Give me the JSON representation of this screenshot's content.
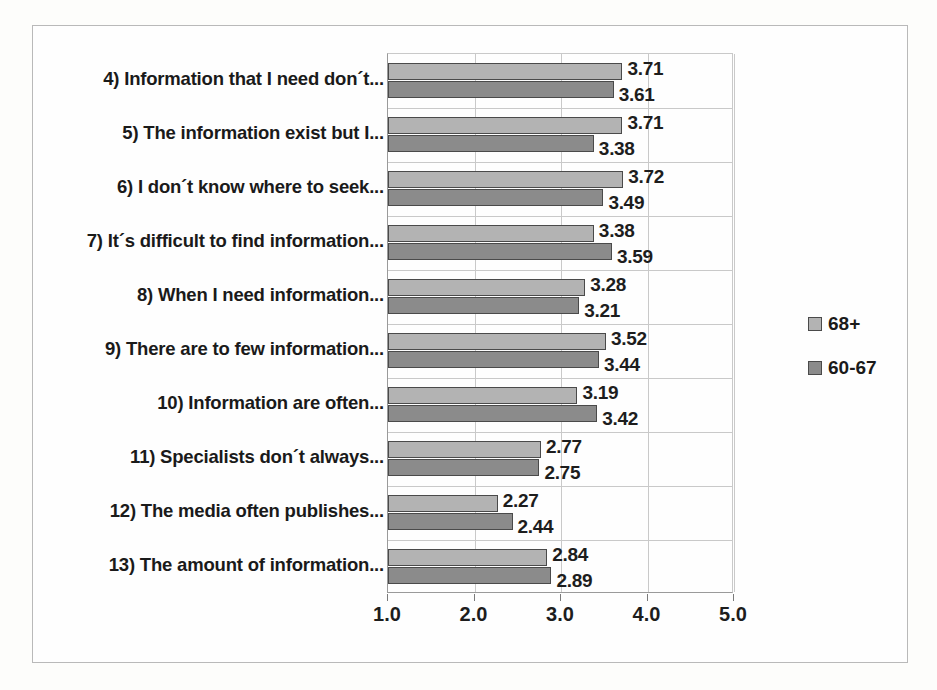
{
  "chart_data": {
    "type": "bar",
    "orientation": "horizontal",
    "title": "",
    "subtitle": "",
    "xlabel": "",
    "ylabel": "",
    "xlim": [
      1.0,
      5.0
    ],
    "xticks": [
      "1.0",
      "2.0",
      "3.0",
      "4.0",
      "5.0"
    ],
    "xtick_values": [
      1.0,
      2.0,
      3.0,
      4.0,
      5.0
    ],
    "grid": "vertical-and-horizontal",
    "legend_position": "right",
    "categories": [
      "4) Information that I need don´t...",
      "5) The information exist but I...",
      "6) I don´t know where to seek...",
      "7) It´s difficult to find information...",
      "8) When I need information...",
      "9) There are to few information...",
      "10) Information are often...",
      "11) Specialists don´t always...",
      "12) The media often publishes...",
      "13) The amount of information..."
    ],
    "series": [
      {
        "name": "68+",
        "color": "#b3b3b3",
        "values": [
          3.71,
          3.71,
          3.72,
          3.38,
          3.28,
          3.52,
          3.19,
          2.77,
          2.27,
          2.84
        ],
        "labels": [
          "3.71",
          "3.71",
          "3.72",
          "3.38",
          "3.28",
          "3.52",
          "3.19",
          "2.77",
          "2.27",
          "2.84"
        ]
      },
      {
        "name": "60-67",
        "color": "#8b8b8b",
        "values": [
          3.61,
          3.38,
          3.49,
          3.59,
          3.21,
          3.44,
          3.42,
          2.75,
          2.44,
          2.89
        ],
        "labels": [
          "3.61",
          "3.38",
          "3.49",
          "3.59",
          "3.21",
          "3.44",
          "3.42",
          "2.75",
          "2.44",
          "2.89"
        ]
      }
    ]
  },
  "legend": {
    "entries": [
      {
        "label": "68+",
        "color": "#b3b3b3"
      },
      {
        "label": "60-67",
        "color": "#8b8b8b"
      }
    ]
  }
}
